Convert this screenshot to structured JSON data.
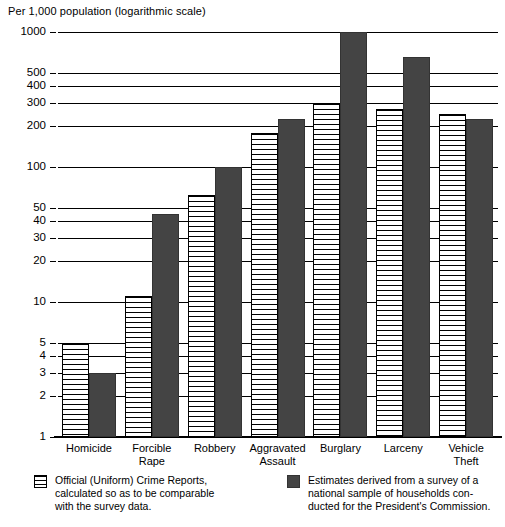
{
  "chart_data": {
    "type": "bar",
    "title": "Per 1,000 population (logarithmic scale)",
    "xlabel": "",
    "ylabel": "Per 1,000 population (logarithmic scale)",
    "scale": "log",
    "ylim": [
      1,
      1000
    ],
    "grid": true,
    "legend_position": "bottom",
    "categories": [
      "Homicide",
      "Forcible\nRape",
      "Robbery",
      "Aggravated\nAssault",
      "Burglary",
      "Larceny",
      "Vehicle\nTheft"
    ],
    "ytick_labels": [
      "1",
      "2",
      "3",
      "4",
      "5",
      "10",
      "20",
      "30",
      "40",
      "50",
      "100",
      "200",
      "300",
      "400",
      "500",
      "1000"
    ],
    "ytick_values": [
      1,
      2,
      3,
      4,
      5,
      10,
      20,
      30,
      40,
      50,
      100,
      200,
      300,
      400,
      500,
      1000
    ],
    "series": [
      {
        "name": "Official (Uniform) Crime Reports,\ncalculated so as to be comparable\nwith the survey data.",
        "short_name": "Official (Uniform) Crime Reports",
        "pattern": "horizontal-lines",
        "color": "#ffffff",
        "values": [
          5.0,
          11.0,
          62.0,
          180.0,
          300.0,
          270.0,
          245.0
        ]
      },
      {
        "name": "Estimates derived from a survey of a\nnational sample of households con-\nducted for the President's Commission.",
        "short_name": "Estimates derived from a survey",
        "pattern": "solid",
        "color": "#444444",
        "values": [
          3.0,
          45.0,
          100.0,
          225.0,
          1000.0,
          650.0,
          225.0
        ]
      }
    ]
  },
  "legend": [
    {
      "swatch": "light",
      "text": "Official (Uniform) Crime Reports,\ncalculated so as to be comparable\nwith the survey data."
    },
    {
      "swatch": "dark",
      "text": "Estimates derived from a survey of a\nnational sample of households con-\nducted for the President's Commission."
    }
  ]
}
